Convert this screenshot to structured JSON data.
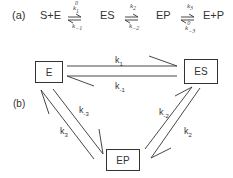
{
  "part_a": {
    "label": "(a)",
    "species": [
      "S+E",
      "ES",
      "EP",
      "E+P"
    ],
    "rates": [
      {
        "forward": "k",
        "forward_sub": "1",
        "forward_sup": "0",
        "reverse": "k",
        "reverse_sub": "−1"
      },
      {
        "forward": "k",
        "forward_sub": "2",
        "reverse": "k",
        "reverse_sub": "−2"
      },
      {
        "forward": "k",
        "forward_sub": "3",
        "reverse": "k",
        "reverse_sub": "−3",
        "reverse_sup": "0"
      }
    ]
  },
  "part_b": {
    "label": "(b)",
    "nodes": {
      "e": "E",
      "es": "ES",
      "ep": "EP"
    },
    "rates": {
      "k1": {
        "base": "k",
        "sub": "1"
      },
      "k_1": {
        "base": "k",
        "sub": "-1"
      },
      "k2": {
        "base": "k",
        "sub": "2"
      },
      "k_2": {
        "base": "k",
        "sub": "-2"
      },
      "k3": {
        "base": "k",
        "sub": "3"
      },
      "k_3": {
        "base": "k",
        "sub": "-3"
      }
    }
  },
  "colors": {
    "line": "#333333",
    "text": "#333333"
  }
}
